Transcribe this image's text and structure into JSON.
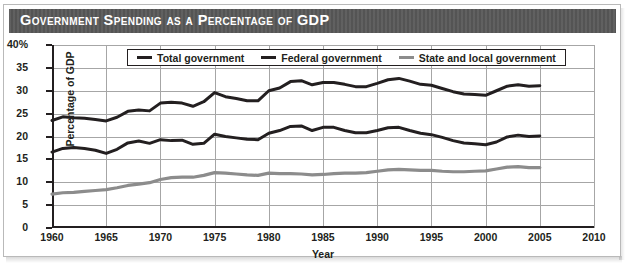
{
  "figure": {
    "title": "Government Spending as a Percentage of GDP"
  },
  "chart_data": {
    "type": "line",
    "title": "Government Spending as a Percentage of GDP",
    "xlabel": "Year",
    "ylabel": "Percentage of GDP",
    "xlim": [
      1960,
      2010
    ],
    "ylim": [
      0,
      40
    ],
    "xticks": [
      "1960",
      "1965",
      "1970",
      "1975",
      "1980",
      "1985",
      "1990",
      "1995",
      "2000",
      "2005",
      "2010"
    ],
    "yticks": [
      "0",
      "5",
      "10",
      "15",
      "20",
      "25",
      "30",
      "35",
      "40%"
    ],
    "grid": true,
    "legend_position": "top-center",
    "x": [
      1960,
      1961,
      1962,
      1963,
      1964,
      1965,
      1966,
      1967,
      1968,
      1969,
      1970,
      1971,
      1972,
      1973,
      1974,
      1975,
      1976,
      1977,
      1978,
      1979,
      1980,
      1981,
      1982,
      1983,
      1984,
      1985,
      1986,
      1987,
      1988,
      1989,
      1990,
      1991,
      1992,
      1993,
      1994,
      1995,
      1996,
      1997,
      1998,
      1999,
      2000,
      2001,
      2002,
      2003,
      2004,
      2005
    ],
    "series": [
      {
        "name": "Total government",
        "color": "#231f20",
        "values": [
          23.5,
          24.3,
          24.1,
          24.0,
          23.7,
          23.4,
          24.2,
          25.5,
          25.8,
          25.6,
          27.3,
          27.5,
          27.3,
          26.6,
          27.6,
          29.6,
          28.7,
          28.3,
          27.8,
          27.8,
          30.0,
          30.6,
          32.0,
          32.2,
          31.3,
          31.8,
          31.8,
          31.4,
          30.9,
          30.9,
          31.6,
          32.4,
          32.7,
          32.1,
          31.4,
          31.2,
          30.5,
          29.8,
          29.3,
          29.2,
          29.0,
          30.0,
          31.0,
          31.3,
          31.0,
          31.1
        ]
      },
      {
        "name": "Federal government",
        "color": "#231f20",
        "values": [
          16.6,
          17.4,
          17.6,
          17.4,
          17.0,
          16.3,
          17.2,
          18.6,
          19.0,
          18.5,
          19.3,
          19.1,
          19.2,
          18.3,
          18.5,
          20.5,
          20.0,
          19.7,
          19.4,
          19.3,
          20.7,
          21.3,
          22.2,
          22.3,
          21.3,
          22.0,
          22.0,
          21.3,
          20.8,
          20.8,
          21.3,
          21.9,
          22.0,
          21.3,
          20.7,
          20.4,
          19.8,
          19.1,
          18.6,
          18.4,
          18.2,
          18.8,
          19.9,
          20.3,
          20.0,
          20.1
        ]
      },
      {
        "name": "State and local government",
        "color": "#8c8c8c",
        "values": [
          7.4,
          7.7,
          7.8,
          8.0,
          8.2,
          8.4,
          8.8,
          9.3,
          9.6,
          9.9,
          10.6,
          11.0,
          11.1,
          11.1,
          11.5,
          12.1,
          12.0,
          11.8,
          11.6,
          11.5,
          12.0,
          11.9,
          11.9,
          11.8,
          11.6,
          11.7,
          11.9,
          12.0,
          12.0,
          12.1,
          12.4,
          12.7,
          12.8,
          12.7,
          12.6,
          12.6,
          12.4,
          12.3,
          12.3,
          12.4,
          12.5,
          12.9,
          13.3,
          13.4,
          13.2,
          13.2
        ]
      }
    ]
  },
  "legend": {
    "items": [
      {
        "label": "Total government",
        "color": "#231f20"
      },
      {
        "label": "Federal government",
        "color": "#231f20"
      },
      {
        "label": "State and local government",
        "color": "#8c8c8c"
      }
    ]
  }
}
